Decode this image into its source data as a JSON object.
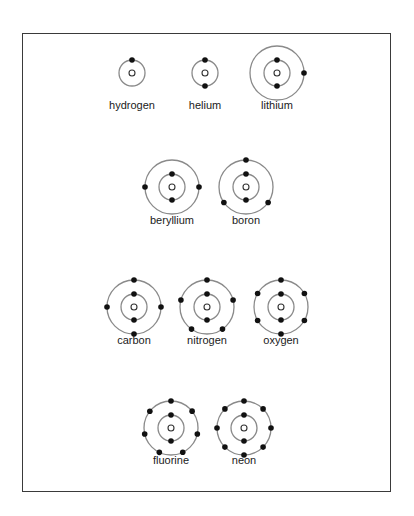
{
  "diagram": {
    "colors": {
      "shell": "#8a8a8a",
      "electron": "#111111",
      "nucleus": "#333333",
      "frame": "#3a3a3a"
    },
    "atoms": [
      {
        "name": "hydrogen",
        "cx": 132,
        "cy": 73,
        "label_y": 106,
        "shells": [
          1
        ]
      },
      {
        "name": "helium",
        "cx": 205,
        "cy": 73,
        "label_y": 106,
        "shells": [
          2
        ]
      },
      {
        "name": "lithium",
        "cx": 277,
        "cy": 73,
        "label_y": 106,
        "shells": [
          2,
          1
        ]
      },
      {
        "name": "beryllium",
        "cx": 172,
        "cy": 187,
        "label_y": 221,
        "shells": [
          2,
          2
        ]
      },
      {
        "name": "boron",
        "cx": 246,
        "cy": 187,
        "label_y": 221,
        "shells": [
          2,
          3
        ]
      },
      {
        "name": "carbon",
        "cx": 134,
        "cy": 307,
        "label_y": 341,
        "shells": [
          2,
          4
        ]
      },
      {
        "name": "nitrogen",
        "cx": 207,
        "cy": 307,
        "label_y": 341,
        "shells": [
          2,
          5
        ]
      },
      {
        "name": "oxygen",
        "cx": 281,
        "cy": 307,
        "label_y": 341,
        "shells": [
          2,
          6
        ]
      },
      {
        "name": "fluorine",
        "cx": 171,
        "cy": 428,
        "label_y": 461,
        "shells": [
          2,
          7
        ]
      },
      {
        "name": "neon",
        "cx": 244,
        "cy": 428,
        "label_y": 461,
        "shells": [
          2,
          8
        ]
      }
    ]
  }
}
